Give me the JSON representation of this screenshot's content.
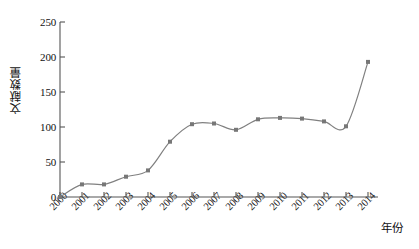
{
  "chart_data": {
    "type": "line",
    "title": "",
    "xlabel": "年份",
    "ylabel": "文献数量",
    "categories": [
      "2000",
      "2001",
      "2002",
      "2003",
      "2004",
      "2005",
      "2006",
      "2007",
      "2008",
      "2009",
      "2010",
      "2011",
      "2012",
      "2013",
      "2014"
    ],
    "values": [
      0,
      18,
      18,
      29,
      38,
      79,
      104,
      105,
      96,
      111,
      113,
      112,
      108,
      101,
      193
    ],
    "series": [
      {
        "name": "文献数量",
        "values": [
          0,
          18,
          18,
          29,
          38,
          79,
          104,
          105,
          96,
          111,
          113,
          112,
          108,
          101,
          193
        ]
      }
    ],
    "ylim": [
      0,
      250
    ],
    "yticks": [
      0,
      50,
      100,
      150,
      200,
      250
    ],
    "ytick_labels": [
      "0",
      "50",
      "100",
      "150",
      "200",
      "250"
    ],
    "xtick_labels": [
      "2000",
      "2001",
      "2002",
      "2003",
      "2004",
      "2005",
      "2006",
      "2007",
      "2008",
      "2009",
      "2010",
      "2011",
      "2012",
      "2013",
      "2014"
    ],
    "grid": false,
    "legend": false,
    "legend_position": "none",
    "line_color": "#808080",
    "marker_color": "#777777",
    "marker_shape": "square",
    "axis_color": "#555555",
    "smoothing": "spline"
  },
  "axes": {
    "y_title": "文献数量",
    "x_title": "年份"
  }
}
